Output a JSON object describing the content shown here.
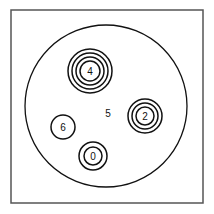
{
  "diagram": {
    "frame": {
      "x": 11,
      "y": 10,
      "width": 192,
      "height": 193,
      "stroke": "#555555"
    },
    "plate": {
      "cx": 106,
      "cy": 106,
      "r": 81,
      "stroke": "#111111"
    },
    "center_label": {
      "text": "5",
      "x": 108,
      "y": 117
    },
    "zones": [
      {
        "label": "4",
        "cx": 90,
        "cy": 71,
        "rings": 4,
        "outer_r": 22,
        "spacing": 4
      },
      {
        "label": "2",
        "cx": 145,
        "cy": 116,
        "rings": 3,
        "outer_r": 17,
        "spacing": 4
      },
      {
        "label": "0",
        "cx": 93,
        "cy": 156,
        "rings": 2,
        "outer_r": 14,
        "spacing": 5
      },
      {
        "label": "6",
        "cx": 63,
        "cy": 127,
        "rings": 1,
        "outer_r": 12,
        "spacing": 0
      }
    ]
  }
}
